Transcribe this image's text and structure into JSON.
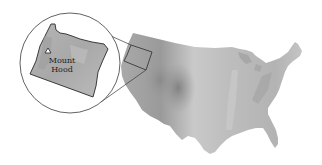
{
  "map": {
    "type": "relief-locator-map",
    "region": "Contiguous United States",
    "inset": {
      "region": "Oregon",
      "shape": "circle",
      "marker": {
        "symbol": "triangle",
        "label_line1": "Mount",
        "label_line2": "Hood"
      }
    },
    "colors": {
      "background": "#ffffff",
      "relief_light": "#d4d4d4",
      "relief_mid": "#b8b8b8",
      "relief_dark": "#8f8f8f",
      "outline": "#3a3a3a"
    }
  }
}
